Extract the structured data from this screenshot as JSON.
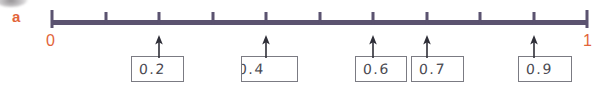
{
  "exercise": {
    "part_label": "a",
    "line": {
      "start_label": "0",
      "end_label": "1",
      "start_value": 0,
      "end_value": 1,
      "tick_count": 11,
      "interval": 0.1,
      "line_color": "#5b5370",
      "label_color": "#e2643a"
    },
    "answers": [
      {
        "value": "0.2",
        "position": 0.2,
        "box_left": 131,
        "box_top": 56,
        "box_width": 53,
        "box_height": 26,
        "text_left": 7,
        "clipped": false
      },
      {
        "value": "0.4",
        "position": 0.4,
        "box_left": 241,
        "box_top": 56,
        "box_width": 57,
        "box_height": 26,
        "text_left": -4,
        "clipped": true
      },
      {
        "value": "0.6",
        "position": 0.6,
        "box_left": 355,
        "box_top": 56,
        "box_width": 52,
        "box_height": 26,
        "text_left": 7,
        "clipped": false
      },
      {
        "value": "0.7",
        "position": 0.7,
        "box_left": 411,
        "box_top": 56,
        "box_width": 53,
        "box_height": 26,
        "text_left": 7,
        "clipped": false
      },
      {
        "value": "0.9",
        "position": 0.9,
        "box_left": 518,
        "box_top": 56,
        "box_width": 54,
        "box_height": 26,
        "text_left": 7,
        "clipped": false
      }
    ]
  }
}
